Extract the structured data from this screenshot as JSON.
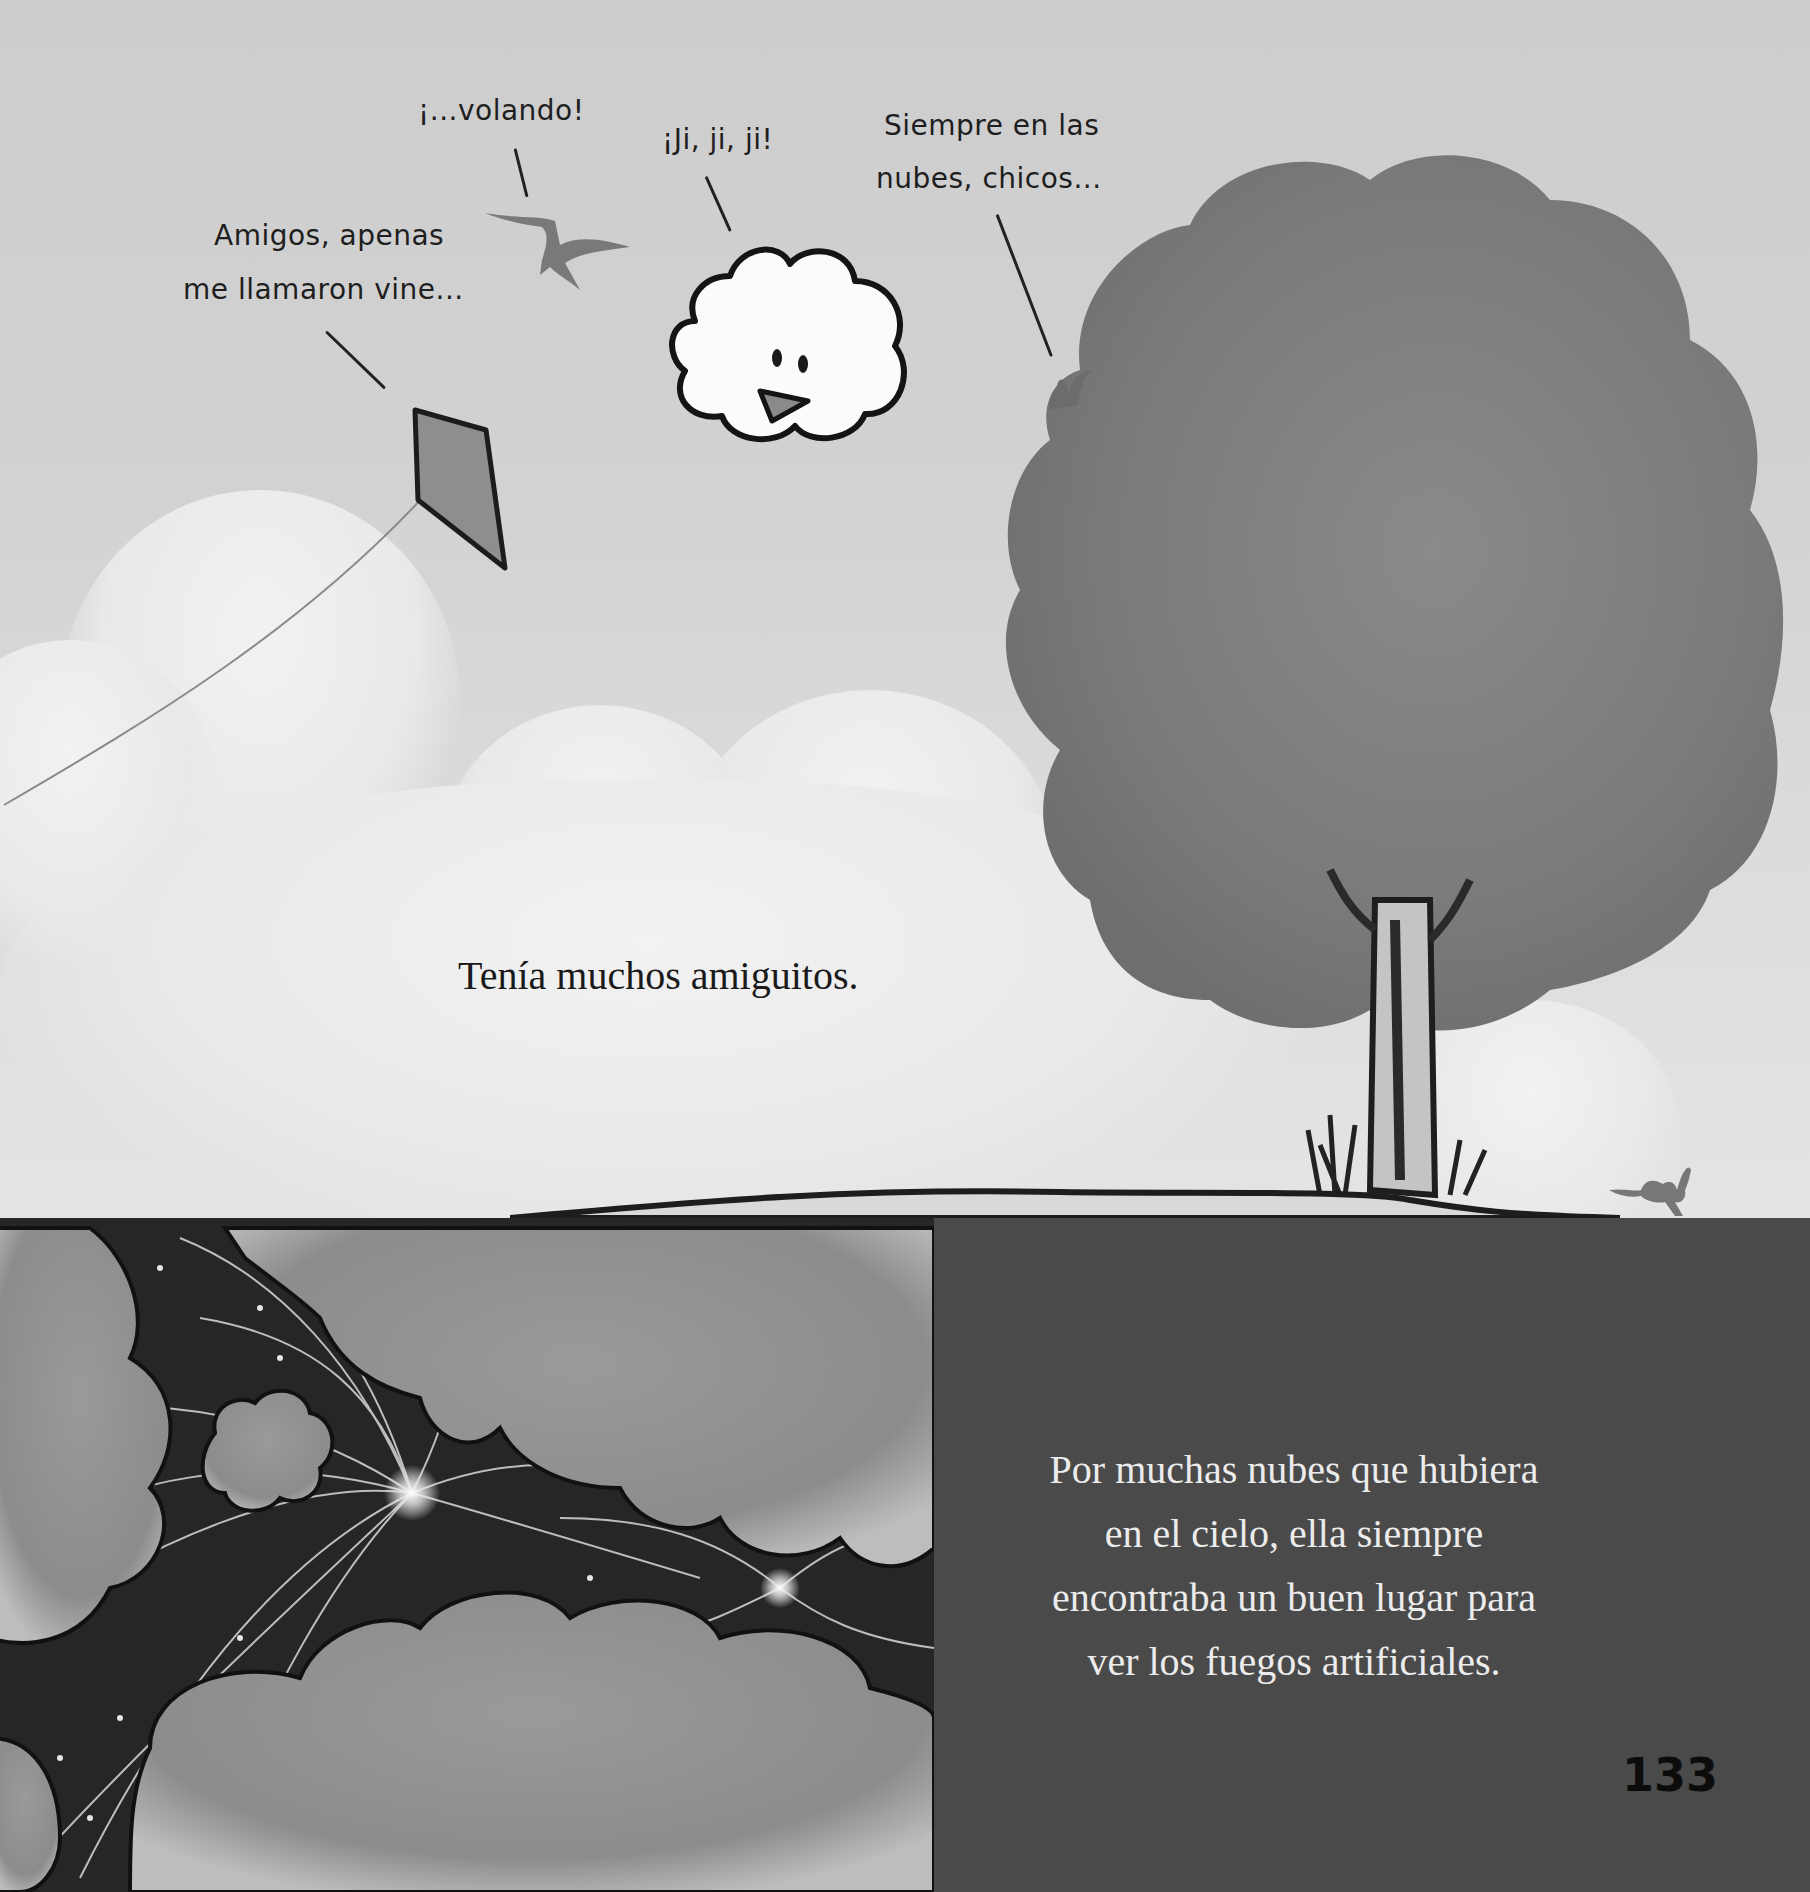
{
  "page": {
    "number": "133"
  },
  "top_scene": {
    "narration": "Tenía muchos amiguitos.",
    "speech_bubbles": [
      {
        "speaker": "kite",
        "lines": [
          "Amigos, apenas",
          "me llamaron vine..."
        ]
      },
      {
        "speaker": "bird",
        "lines": [
          "¡...volando!"
        ]
      },
      {
        "speaker": "cloud",
        "lines": [
          "¡Ji, ji, ji!"
        ]
      },
      {
        "speaker": "squirrel",
        "lines": [
          "Siempre en las",
          "nubes, chicos..."
        ]
      }
    ],
    "illustration_elements": [
      "kite-icon",
      "bird-icon",
      "smiling-cloud-icon",
      "squirrel-icon",
      "tree-icon",
      "rabbit-icon",
      "hill-icon"
    ]
  },
  "bottom_left": {
    "illustration_elements": [
      "clouds-icon",
      "fireworks-icon",
      "small-cloud-icon"
    ]
  },
  "bottom_right": {
    "lines": [
      "Por muchas nubes que hubiera",
      "en el cielo, ella siempre",
      "encontraba un buen lugar para",
      "ver los fuegos artificiales."
    ]
  },
  "colors": {
    "sky": "#d0d0d0",
    "panel": "#4a4a4a",
    "night": "#262626",
    "text_dark": "#1a1a1a",
    "text_light": "#ececec"
  }
}
